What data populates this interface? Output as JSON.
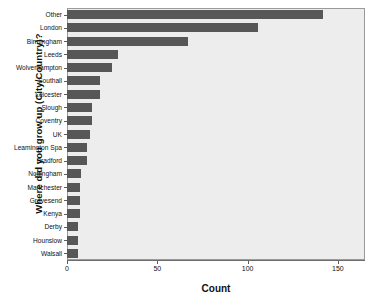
{
  "chart_data": {
    "type": "bar",
    "orientation": "horizontal",
    "title": "",
    "xlabel": "Count",
    "ylabel": "Where did you grow up (City/Country)?",
    "xlim": [
      0,
      165
    ],
    "xticks": [
      0,
      50,
      100,
      150
    ],
    "xtick_labels": [
      "0",
      "50",
      "100",
      "150"
    ],
    "grid": false,
    "legend": false,
    "bar_color": "#575757",
    "plot_background": "#ededed",
    "categories": [
      "Other",
      "London",
      "Birmingham",
      "Leeds",
      "Wolverhampton",
      "Southall",
      "Leicester",
      "Slough",
      "Coventry",
      "UK",
      "Leamington Spa",
      "Bradford",
      "Nottingham",
      "Manchester",
      "Gravesend",
      "Kenya",
      "Derby",
      "Hounslow",
      "Walsall"
    ],
    "values": [
      142,
      106,
      67,
      28,
      25,
      18,
      18,
      14,
      14,
      13,
      11,
      11,
      8,
      7,
      7,
      7,
      6,
      6,
      6
    ]
  }
}
